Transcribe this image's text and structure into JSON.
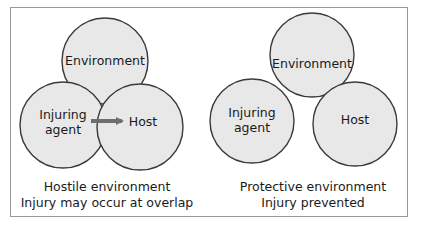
{
  "diagrams": [
    {
      "id": "hostile",
      "circles": {
        "environment": {
          "label": "Environment"
        },
        "agent": {
          "label_line1": "Injuring",
          "label_line2": "agent"
        },
        "host": {
          "label": "Host"
        }
      },
      "arrow": {
        "from": "Injuring agent",
        "to": "Host",
        "color": "#6e6e6e"
      },
      "caption_line1": "Hostile environment",
      "caption_line2": "Injury may occur at overlap"
    },
    {
      "id": "protective",
      "circles": {
        "environment": {
          "label": "Environment"
        },
        "agent": {
          "label_line1": "Injuring",
          "label_line2": "agent"
        },
        "host": {
          "label": "Host"
        }
      },
      "caption_line1": "Protective environment",
      "caption_line2": "Injury prevented"
    }
  ],
  "colors": {
    "circle_fill": "#e8e8e8",
    "circle_stroke": "#3a3a3a",
    "frame_border": "#9a9a9a",
    "arrow": "#6e6e6e"
  }
}
